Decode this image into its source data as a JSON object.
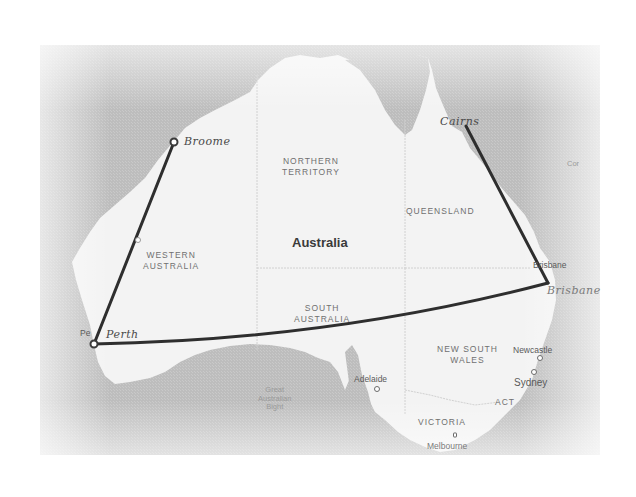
{
  "map": {
    "country_label": "Australia",
    "colors": {
      "ocean": "#b9b9b9",
      "land": "#f2f2f2",
      "route": "#2e2e2e",
      "border": "#d4d4d4"
    },
    "regions": [
      {
        "id": "northern-territory",
        "line1": "NORTHERN",
        "line2": "TERRITORY"
      },
      {
        "id": "western-australia",
        "line1": "WESTERN",
        "line2": "AUSTRALIA"
      },
      {
        "id": "queensland",
        "line1": "QUEENSLAND",
        "line2": ""
      },
      {
        "id": "south-australia",
        "line1": "SOUTH",
        "line2": "AUSTRALIA"
      },
      {
        "id": "new-south-wales",
        "line1": "NEW SOUTH",
        "line2": "WALES"
      },
      {
        "id": "victoria",
        "line1": "VICTORIA",
        "line2": ""
      },
      {
        "id": "act",
        "line1": "ACT",
        "line2": ""
      }
    ],
    "cities": [
      {
        "id": "brisbane",
        "label": "Brisbane"
      },
      {
        "id": "newcastle",
        "label": "Newcastle"
      },
      {
        "id": "sydney",
        "label": "Sydney"
      },
      {
        "id": "adelaide",
        "label": "Adelaide"
      },
      {
        "id": "melbourne",
        "label": "Melbourne"
      },
      {
        "id": "perth",
        "label": "Pe"
      }
    ],
    "seas": [
      {
        "id": "great-australian-bight",
        "line1": "Great",
        "line2": "Australian",
        "line3": "Bight"
      },
      {
        "id": "coral-sea",
        "line1": "Cor"
      }
    ],
    "route": {
      "stops": [
        {
          "id": "broome",
          "label": "Broome"
        },
        {
          "id": "perth",
          "label": "Perth"
        },
        {
          "id": "brisbane",
          "label": "Brisbane"
        },
        {
          "id": "cairns",
          "label": "Cairns"
        }
      ]
    }
  }
}
